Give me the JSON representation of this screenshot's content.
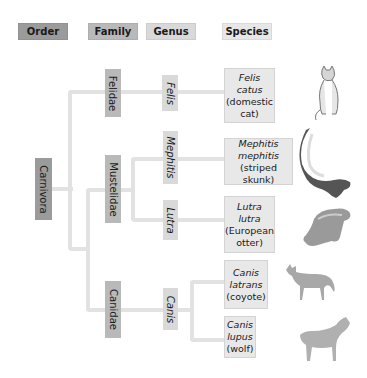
{
  "headers": {
    "order": "Order",
    "family": "Family",
    "genus": "Genus",
    "species": "Species"
  },
  "order": {
    "label": "Carnivora"
  },
  "families": [
    {
      "label": "Felidae"
    },
    {
      "label": "Mustelidae"
    },
    {
      "label": "Canidae"
    }
  ],
  "genera": [
    {
      "label": "Felis"
    },
    {
      "label": "Mephitis"
    },
    {
      "label": "Lutra"
    },
    {
      "label": "Canis"
    }
  ],
  "species": [
    {
      "genus": "Felis",
      "epithet": "catus",
      "common": "(domestic",
      "common2": "cat)",
      "animal": "cat-icon"
    },
    {
      "genus": "Mephitis",
      "epithet": "mephitis",
      "common": "(striped skunk)",
      "common2": "",
      "animal": "skunk-icon"
    },
    {
      "genus": "Lutra",
      "epithet": "lutra",
      "common": "(European",
      "common2": "otter)",
      "animal": "otter-icon"
    },
    {
      "genus": "Canis",
      "epithet": "latrans",
      "common": "(coyote)",
      "common2": "",
      "animal": "coyote-icon"
    },
    {
      "genus": "Canis",
      "epithet": "lupus",
      "common": "(wolf)",
      "common2": "",
      "animal": "wolf-icon"
    }
  ],
  "colors": {
    "order": "#9b9b9b",
    "family": "#b9b9b9",
    "genus": "#d9d9d9",
    "species": "#e7e7e7",
    "lines": "#e2e2e2"
  }
}
